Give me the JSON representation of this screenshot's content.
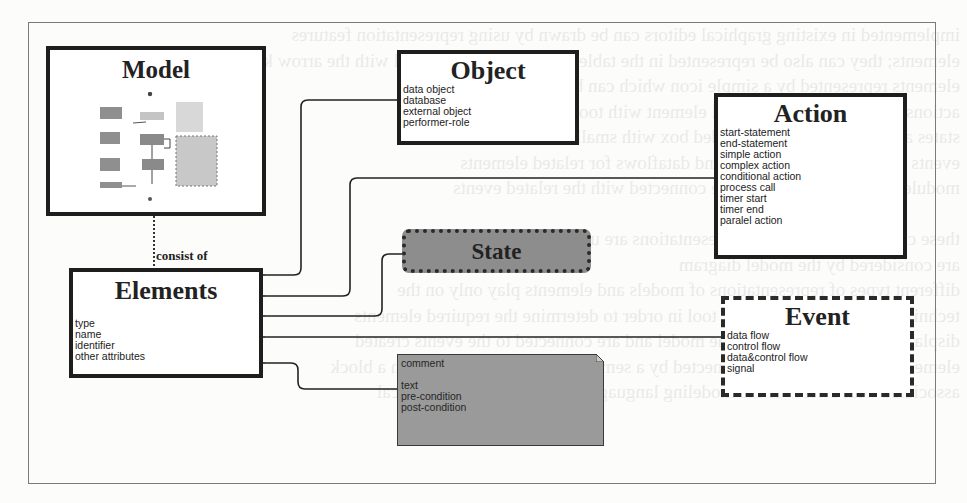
{
  "diagram": {
    "model": {
      "title": "Model",
      "thumbnail": "miniature-process-diagram"
    },
    "relation_label": "consist of",
    "elements": {
      "title": "Elements",
      "attributes": [
        "type",
        "name",
        "identifier",
        "other attributes"
      ]
    },
    "object": {
      "title": "Object",
      "items": [
        "data object",
        "database",
        "external object",
        "performer-role"
      ]
    },
    "action": {
      "title": "Action",
      "items": [
        "start-statement",
        "end-statement",
        "simple action",
        "complex action",
        "conditional action",
        "process call",
        "timer start",
        "timer end",
        "paralel action"
      ]
    },
    "state": {
      "title": "State"
    },
    "event": {
      "title": "Event",
      "items": [
        "data flow",
        "control flow",
        "data&control flow",
        "signal"
      ]
    },
    "comment": {
      "items": [
        "comment",
        "",
        "text",
        "pre-condition",
        "post-condition"
      ]
    },
    "connectors": [
      {
        "from": "model",
        "to": "elements",
        "style": "dashed",
        "label": "consist of"
      },
      {
        "from": "object",
        "to": "elements",
        "style": "generalization"
      },
      {
        "from": "action",
        "to": "elements",
        "style": "generalization"
      },
      {
        "from": "state",
        "to": "elements",
        "style": "generalization"
      },
      {
        "from": "event",
        "to": "elements",
        "style": "generalization"
      },
      {
        "from": "comment",
        "to": "elements",
        "style": "generalization"
      }
    ],
    "colors": {
      "box_border": "#1e1e1e",
      "state_fill": "#8d8d8d",
      "comment_fill": "#9a9a9a",
      "background": "#fcfcfb"
    }
  },
  "background_bleed": [
    "implemented in existing graphical editors can be drawn by using representation features",
    "elements; they can also be represented in the table from the original model with the arrow keys",
    "elements represented by a simple icon which can be connected to these",
    "actions are shown by a graphical element with tooltip as title",
    "states are represented by a rounded box with small dotted borders",
    "events are represented by lines and dataflows for related elements",
    "modules and model elements are connected with the related events",
    "",
    "these cases of the graphical representations are used by the elements",
    "are considered by the model diagram",
    "different types of representations of models and elements play only on the",
    "technical aspects of a modeling tool in order to determine the required elements",
    "display are represented in the the model and are connected to the events created",
    "elements are described and connected by a semantic diagram and shown in a block",
    "associated with a view of the modeling language for the associated graphical"
  ]
}
